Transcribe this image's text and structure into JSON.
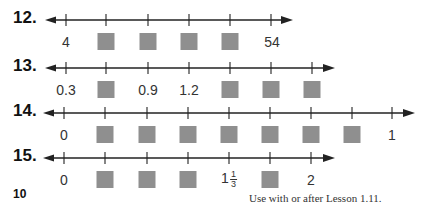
{
  "problems": [
    {
      "number": "12.",
      "axis_y": 20,
      "axis_start": 45,
      "axis_end": 293,
      "ticks": [
        66,
        106,
        148,
        189,
        230,
        271
      ],
      "label_y": 33,
      "labels": [
        {
          "x": 66,
          "text": "4"
        },
        {
          "x": 106,
          "box": true
        },
        {
          "x": 148,
          "box": true
        },
        {
          "x": 189,
          "box": true
        },
        {
          "x": 230,
          "box": true
        },
        {
          "x": 272,
          "text": "54"
        }
      ]
    },
    {
      "number": "13.",
      "axis_y": 68,
      "axis_start": 45,
      "axis_end": 335,
      "ticks": [
        66,
        106,
        148,
        189,
        230,
        271,
        312
      ],
      "label_y": 81,
      "labels": [
        {
          "x": 66,
          "text": "0.3"
        },
        {
          "x": 106,
          "box": true
        },
        {
          "x": 148,
          "text": "0.9"
        },
        {
          "x": 189,
          "text": "1.2"
        },
        {
          "x": 230,
          "box": true
        },
        {
          "x": 271,
          "box": true
        },
        {
          "x": 312,
          "box": true
        }
      ]
    },
    {
      "number": "14.",
      "axis_y": 113,
      "axis_start": 43,
      "axis_end": 415,
      "ticks": [
        64,
        105,
        147,
        188,
        229,
        270,
        311,
        352,
        392
      ],
      "label_y": 126,
      "labels": [
        {
          "x": 64,
          "text": "0"
        },
        {
          "x": 105,
          "box": true
        },
        {
          "x": 147,
          "box": true
        },
        {
          "x": 188,
          "box": true
        },
        {
          "x": 229,
          "box": true
        },
        {
          "x": 270,
          "box": true
        },
        {
          "x": 311,
          "box": true
        },
        {
          "x": 352,
          "box": true
        },
        {
          "x": 392,
          "text": "1"
        }
      ]
    },
    {
      "number": "15.",
      "axis_y": 158,
      "axis_start": 43,
      "axis_end": 335,
      "ticks": [
        64,
        105,
        147,
        188,
        229,
        270,
        311
      ],
      "label_y": 171,
      "labels": [
        {
          "x": 64,
          "text": "0"
        },
        {
          "x": 105,
          "box": true
        },
        {
          "x": 147,
          "box": true
        },
        {
          "x": 188,
          "box": true
        },
        {
          "x": 229,
          "mixed": {
            "whole": "1",
            "num": "1",
            "den": "3"
          }
        },
        {
          "x": 270,
          "box": true
        },
        {
          "x": 311,
          "text": "2"
        }
      ]
    }
  ],
  "page_number": "10",
  "footer": "Use with or after Lesson 1.11.",
  "colors": {
    "box": "#8f8f8f",
    "line": "#222222"
  }
}
